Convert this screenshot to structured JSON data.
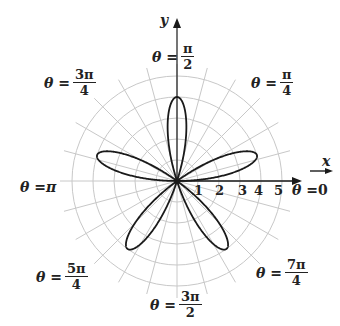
{
  "chart_data": {
    "type": "line",
    "subtype": "polar-rose",
    "title": "",
    "equation_visual": "r = 4 sin 5θ",
    "petals": 5,
    "amplitude": 4,
    "petal_angles_deg": [
      18,
      90,
      162,
      234,
      306
    ],
    "radial_ticks": [
      "1",
      "2",
      "3",
      "4",
      "5"
    ],
    "rlim": [
      0,
      5
    ],
    "grid": {
      "circles": 5,
      "radial_line_step_deg": 15
    },
    "xlabel": "x",
    "ylabel": "y",
    "angle_labels": [
      {
        "id": "t0",
        "prefix": "θ = ",
        "num": "0",
        "den": ""
      },
      {
        "id": "t45",
        "prefix": "θ = ",
        "num": "π",
        "den": "4"
      },
      {
        "id": "t90",
        "prefix": "θ = ",
        "num": "π",
        "den": "2"
      },
      {
        "id": "t135",
        "prefix": "θ = ",
        "num": "3π",
        "den": "4"
      },
      {
        "id": "t180",
        "prefix": "θ = ",
        "num": "π",
        "den": ""
      },
      {
        "id": "t225",
        "prefix": "θ = ",
        "num": "5π",
        "den": "4"
      },
      {
        "id": "t270",
        "prefix": "θ = ",
        "num": "3π",
        "den": "2"
      },
      {
        "id": "t315",
        "prefix": "θ = ",
        "num": "7π",
        "den": "4"
      }
    ]
  },
  "colors": {
    "curve": "#1a1a1a",
    "grid": "#c8c8c8",
    "axis": "#1a1a1a",
    "text": "#222222"
  }
}
